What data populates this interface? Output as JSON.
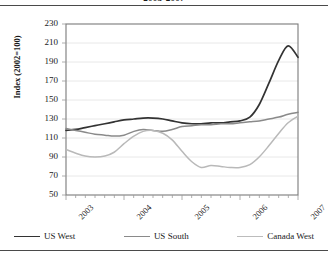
{
  "chart_data": {
    "type": "line",
    "title": "2003-2007",
    "xlabel": "",
    "ylabel": "Index (2002=100)",
    "ylim": [
      50,
      230
    ],
    "yticks": [
      50,
      70,
      90,
      110,
      130,
      150,
      170,
      190,
      210,
      230
    ],
    "xticks": [
      "2003",
      "2004",
      "2005",
      "2006",
      "2007"
    ],
    "xlim": [
      2003,
      2007
    ],
    "grid": true,
    "legend_position": "bottom",
    "series": [
      {
        "name": "US West",
        "color": "#333333",
        "width": 1.7,
        "x": [
          2003.0,
          2003.17,
          2003.33,
          2003.5,
          2003.67,
          2003.83,
          2004.0,
          2004.17,
          2004.33,
          2004.5,
          2004.67,
          2004.83,
          2005.0,
          2005.17,
          2005.33,
          2005.5,
          2005.67,
          2005.83,
          2006.0,
          2006.17,
          2006.33,
          2006.5,
          2006.67,
          2006.83,
          2007.0
        ],
        "values": [
          118,
          119,
          121,
          123,
          125,
          127,
          129,
          130,
          131,
          131,
          130,
          128,
          126,
          125,
          125,
          126,
          126,
          127,
          128,
          132,
          145,
          168,
          192,
          207,
          195
        ]
      },
      {
        "name": "US South",
        "color": "#8a8a8a",
        "width": 1.5,
        "x": [
          2003.0,
          2003.17,
          2003.33,
          2003.5,
          2003.67,
          2003.83,
          2004.0,
          2004.17,
          2004.33,
          2004.5,
          2004.67,
          2004.83,
          2005.0,
          2005.17,
          2005.33,
          2005.5,
          2005.67,
          2005.83,
          2006.0,
          2006.17,
          2006.33,
          2006.5,
          2006.67,
          2006.83,
          2007.0
        ],
        "values": [
          120,
          118,
          116,
          114,
          113,
          112,
          113,
          117,
          119,
          118,
          117,
          119,
          122,
          123,
          124,
          124,
          125,
          125,
          126,
          127,
          128,
          130,
          132,
          135,
          137
        ]
      },
      {
        "name": "Canada West",
        "color": "#b9b9b9",
        "width": 1.5,
        "x": [
          2003.0,
          2003.17,
          2003.33,
          2003.5,
          2003.67,
          2003.83,
          2004.0,
          2004.17,
          2004.33,
          2004.5,
          2004.67,
          2004.83,
          2005.0,
          2005.17,
          2005.33,
          2005.5,
          2005.67,
          2005.83,
          2006.0,
          2006.17,
          2006.33,
          2006.5,
          2006.67,
          2006.83,
          2007.0
        ],
        "values": [
          98,
          94,
          91,
          90,
          91,
          95,
          104,
          112,
          117,
          118,
          115,
          108,
          96,
          85,
          79,
          81,
          80,
          79,
          79,
          82,
          90,
          102,
          115,
          126,
          133
        ]
      }
    ]
  },
  "legend": {
    "items": [
      {
        "label": "US West",
        "color": "#333333",
        "width": 1.9
      },
      {
        "label": "US South",
        "color": "#8a8a8a",
        "width": 1.6
      },
      {
        "label": "Canada West",
        "color": "#bcbcbc",
        "width": 1.5
      }
    ]
  },
  "axes": {
    "axis_color": "#7a7a7a",
    "grid_color": "#e2e2e2",
    "tick_color": "#9a9a9a"
  }
}
